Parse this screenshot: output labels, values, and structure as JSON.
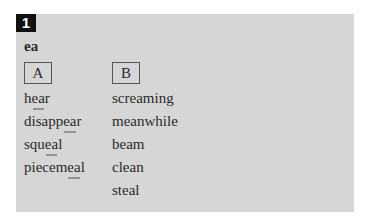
{
  "exercise": {
    "number": "1",
    "heading": "ea",
    "columns": [
      {
        "label": "A",
        "words": [
          {
            "pre": "h",
            "hl": "ea",
            "post": "r"
          },
          {
            "pre": "disapp",
            "hl": "ea",
            "post": "r"
          },
          {
            "pre": "squ",
            "hl": "ea",
            "post": "l"
          },
          {
            "pre": "piecem",
            "hl": "ea",
            "post": "l"
          }
        ]
      },
      {
        "label": "B",
        "words": [
          {
            "text": "screaming"
          },
          {
            "text": "meanwhile"
          },
          {
            "text": "beam"
          },
          {
            "text": "clean"
          },
          {
            "text": "steal"
          }
        ]
      }
    ]
  },
  "colors": {
    "panel": "#d6d6d6",
    "underline": "#8f9296",
    "number_badge": "#111111"
  }
}
